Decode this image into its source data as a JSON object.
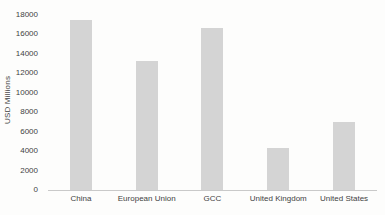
{
  "chart_data": {
    "type": "bar",
    "categories": [
      "China",
      "European Union",
      "GCC",
      "United Kingdom",
      "United States"
    ],
    "values": [
      17500,
      13300,
      16700,
      4300,
      7000
    ],
    "title": "",
    "xlabel": "",
    "ylabel": "USD Millions",
    "ylim": [
      0,
      18000
    ],
    "ytick_step": 2000,
    "ytick_labels": [
      "0",
      "2000",
      "4000",
      "6000",
      "8000",
      "10000",
      "12000",
      "14000",
      "16000",
      "18000"
    ],
    "legend_position": "none",
    "grid": false,
    "bar_color": "#d4d4d4",
    "axis_line_color": "#c9c9c9",
    "text_color": "#3f3f3f",
    "background_color": "#fdfdfc"
  }
}
